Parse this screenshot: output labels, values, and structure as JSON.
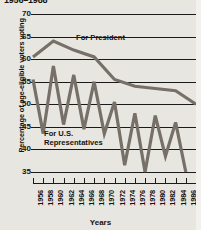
{
  "chart_data": {
    "type": "line",
    "title": "1956–1988",
    "xlabel": "Years",
    "ylabel": "Percentage of age-eligible voters voting",
    "ylim": [
      35,
      70
    ],
    "yticks": [
      70,
      65,
      60,
      55,
      50,
      45,
      40,
      35
    ],
    "xticks": [
      1956,
      1958,
      1960,
      1962,
      1964,
      1966,
      1968,
      1970,
      1972,
      1974,
      1976,
      1978,
      1980,
      1982,
      1984,
      1986,
      1988
    ],
    "grid": true,
    "legend_position": "inline-annotations",
    "x": [
      1956,
      1958,
      1960,
      1962,
      1964,
      1966,
      1968,
      1970,
      1972,
      1974,
      1976,
      1978,
      1980,
      1982,
      1984,
      1986
    ],
    "series": [
      {
        "name": "For President",
        "annotation": "For President",
        "x": [
          1956,
          1960,
          1964,
          1968,
          1972,
          1976,
          1980,
          1984,
          1988
        ],
        "values": [
          60.5,
          64.0,
          62.0,
          60.5,
          55.5,
          54.0,
          53.5,
          53.0,
          50.0
        ]
      },
      {
        "name": "For U.S. Representatives",
        "annotation": "For U.S.\nRepresentatives",
        "x": [
          1956,
          1958,
          1960,
          1962,
          1964,
          1966,
          1968,
          1970,
          1972,
          1974,
          1976,
          1978,
          1980,
          1982,
          1984,
          1986
        ],
        "values": [
          55.5,
          43.5,
          58.5,
          45.5,
          56.5,
          44.5,
          55.0,
          43.5,
          50.5,
          36.5,
          48.0,
          35.0,
          47.5,
          38.5,
          46.0,
          35.0
        ]
      }
    ],
    "colors": {
      "line": "#767068",
      "grid": "#1a1a1a",
      "background": "#e8e6e1",
      "text": "#15120f"
    }
  },
  "annotations": {
    "president": "For President",
    "reps_line1": "For U.S.",
    "reps_line2": "Representatives"
  },
  "axes": {
    "y_title": "Percentage of age-eligible voters voting",
    "x_title": "Years"
  }
}
